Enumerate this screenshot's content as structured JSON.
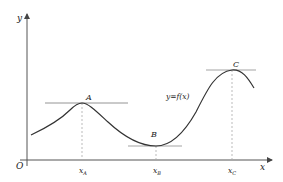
{
  "diagram": {
    "type": "function-extrema",
    "colors": {
      "axis": "#555555",
      "curve": "#333333",
      "tangent": "#999999",
      "dashed": "#aaaaaa",
      "text": "#222222"
    },
    "axes": {
      "origin_label": "O",
      "x_label": "x",
      "y_label": "y"
    },
    "curve_label": "y=f(x)",
    "points": [
      {
        "name": "A",
        "kind": "local maximum",
        "x_label_main": "x",
        "x_label_sub": "A"
      },
      {
        "name": "B",
        "kind": "local minimum",
        "x_label_main": "x",
        "x_label_sub": "B"
      },
      {
        "name": "C",
        "kind": "local maximum",
        "x_label_main": "x",
        "x_label_sub": "C"
      }
    ]
  }
}
